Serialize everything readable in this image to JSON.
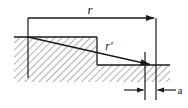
{
  "figure": {
    "type": "engineering-cross-section-diagram",
    "background_color": "#ffffff",
    "line_color": "#1a1a1a",
    "hatch_color": "#6b6b6b",
    "hatch_angle_deg": 45,
    "width_px": 188,
    "height_px": 108
  },
  "labels": {
    "r": "r",
    "r_prime": "r′",
    "a": "a"
  },
  "dimensions": {
    "r": {
      "name": "r",
      "kind": "overall-span",
      "line_y": 18,
      "x_start": 28,
      "x_end": 156,
      "arrow_end": "right",
      "label_x": 90,
      "label_y": 13
    },
    "r_prime": {
      "name": "r′",
      "kind": "diagonal-vector",
      "x_start": 28,
      "y_start": 37,
      "x_end": 152,
      "y_end": 65,
      "arrow_end": "end",
      "label_x": 109,
      "label_y": 48
    },
    "a": {
      "name": "a",
      "kind": "small-gap",
      "line_y": 90,
      "x_left_tick": 145,
      "x_right_tick": 156,
      "arrow_left_from": 124,
      "arrow_right_from": 176,
      "label_x": 180,
      "label_y": 93
    }
  },
  "geometry": {
    "hatched_body": {
      "name": "stepped-hatched-region",
      "points": "14,37 97,37 97,65 170,65 170,82 14,82"
    },
    "upper_surface": {
      "x1": 14,
      "y1": 37,
      "x2": 97,
      "y2": 37
    },
    "step_face": {
      "x1": 97,
      "y1": 37,
      "x2": 97,
      "y2": 65
    },
    "lower_surface": {
      "x1": 97,
      "y1": 65,
      "x2": 170,
      "y2": 65
    },
    "extension_line_left": {
      "x": 28,
      "y1": 18,
      "y2": 78
    },
    "extension_line_right": {
      "x": 156,
      "y1": 18,
      "y2": 100
    },
    "tick_line_inner": {
      "x": 145,
      "y1": 52,
      "y2": 100
    }
  }
}
